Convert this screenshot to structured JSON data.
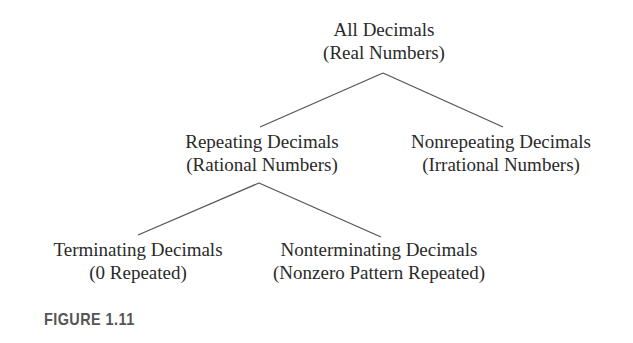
{
  "diagram": {
    "type": "tree",
    "nodes": [
      {
        "id": "root",
        "line1": "All Decimals",
        "line2": "(Real Numbers)"
      },
      {
        "id": "repeating",
        "line1": "Repeating Decimals",
        "line2": "(Rational Numbers)"
      },
      {
        "id": "nonrepeating",
        "line1": "Nonrepeating Decimals",
        "line2": "(Irrational Numbers)"
      },
      {
        "id": "terminating",
        "line1": "Terminating Decimals",
        "line2": "(0 Repeated)"
      },
      {
        "id": "nonterminating",
        "line1": "Nonterminating Decimals",
        "line2": "(Nonzero Pattern Repeated)"
      }
    ],
    "edges": [
      {
        "from": "root",
        "to": "repeating"
      },
      {
        "from": "root",
        "to": "nonrepeating"
      },
      {
        "from": "repeating",
        "to": "terminating"
      },
      {
        "from": "repeating",
        "to": "nonterminating"
      }
    ],
    "line_color": "#555555",
    "text_color": "#2a2a2a"
  },
  "caption": "FIGURE 1.11"
}
